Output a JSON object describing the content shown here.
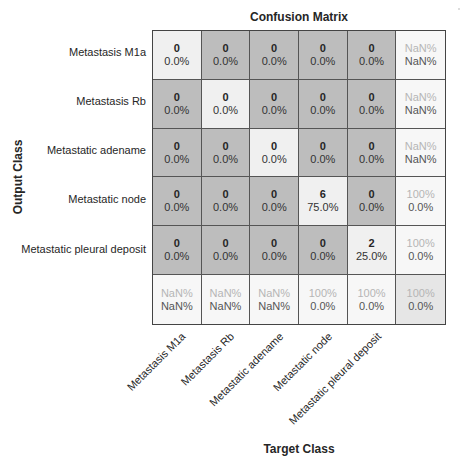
{
  "chart_data": {
    "type": "heatmap",
    "title": "Confusion Matrix",
    "xlabel": "Target Class",
    "ylabel": "Output Class",
    "classes": [
      "Metastasis M1a",
      "Metastasis Rb",
      "Metastatic adename",
      "Metastatic node",
      "Metastatic pleural deposit"
    ],
    "counts": [
      [
        0,
        0,
        0,
        0,
        0
      ],
      [
        0,
        0,
        0,
        0,
        0
      ],
      [
        0,
        0,
        0,
        0,
        0
      ],
      [
        0,
        0,
        0,
        6,
        0
      ],
      [
        0,
        0,
        0,
        0,
        2
      ]
    ],
    "percentages": [
      [
        "0.0%",
        "0.0%",
        "0.0%",
        "0.0%",
        "0.0%"
      ],
      [
        "0.0%",
        "0.0%",
        "0.0%",
        "0.0%",
        "0.0%"
      ],
      [
        "0.0%",
        "0.0%",
        "0.0%",
        "0.0%",
        "0.0%"
      ],
      [
        "0.0%",
        "0.0%",
        "0.0%",
        "75.0%",
        "0.0%"
      ],
      [
        "0.0%",
        "0.0%",
        "0.0%",
        "0.0%",
        "25.0%"
      ]
    ],
    "row_summary": [
      [
        "NaN%",
        "NaN%"
      ],
      [
        "NaN%",
        "NaN%"
      ],
      [
        "NaN%",
        "NaN%"
      ],
      [
        "100%",
        "0.0%"
      ],
      [
        "100%",
        "0.0%"
      ]
    ],
    "col_summary": [
      [
        "NaN%",
        "NaN%"
      ],
      [
        "NaN%",
        "NaN%"
      ],
      [
        "NaN%",
        "NaN%"
      ],
      [
        "100%",
        "0.0%"
      ],
      [
        "100%",
        "0.0%"
      ]
    ],
    "overall": [
      "100%",
      "0.0%"
    ],
    "x_tick_labels": [
      "Metastasis M1a",
      "Metastasis Rb",
      "Metastatic adename",
      "Metastatic node",
      "Metastatic pleural deposit"
    ],
    "colors": {
      "diag": "#f2f2f2",
      "offdiag": "#bdbdbd",
      "summary": "#f7f7f7",
      "overall": "#e6e6e6"
    }
  },
  "cells": [
    {
      "c": "0",
      "p": "0.0%",
      "bg": "#f0f0f0"
    },
    {
      "c": "0",
      "p": "0.0%",
      "bg": "#bdbdbd"
    },
    {
      "c": "0",
      "p": "0.0%",
      "bg": "#bdbdbd"
    },
    {
      "c": "0",
      "p": "0.0%",
      "bg": "#bdbdbd"
    },
    {
      "c": "0",
      "p": "0.0%",
      "bg": "#bdbdbd"
    },
    {
      "c": "NaN%",
      "p": "NaN%",
      "bg": "#f7f7f7",
      "s": 1
    },
    {
      "c": "0",
      "p": "0.0%",
      "bg": "#bdbdbd"
    },
    {
      "c": "0",
      "p": "0.0%",
      "bg": "#f0f0f0"
    },
    {
      "c": "0",
      "p": "0.0%",
      "bg": "#bdbdbd"
    },
    {
      "c": "0",
      "p": "0.0%",
      "bg": "#bdbdbd"
    },
    {
      "c": "0",
      "p": "0.0%",
      "bg": "#bdbdbd"
    },
    {
      "c": "NaN%",
      "p": "NaN%",
      "bg": "#f7f7f7",
      "s": 1
    },
    {
      "c": "0",
      "p": "0.0%",
      "bg": "#bdbdbd"
    },
    {
      "c": "0",
      "p": "0.0%",
      "bg": "#bdbdbd"
    },
    {
      "c": "0",
      "p": "0.0%",
      "bg": "#f0f0f0"
    },
    {
      "c": "0",
      "p": "0.0%",
      "bg": "#bdbdbd"
    },
    {
      "c": "0",
      "p": "0.0%",
      "bg": "#bdbdbd"
    },
    {
      "c": "NaN%",
      "p": "NaN%",
      "bg": "#f7f7f7",
      "s": 1
    },
    {
      "c": "0",
      "p": "0.0%",
      "bg": "#bdbdbd"
    },
    {
      "c": "0",
      "p": "0.0%",
      "bg": "#bdbdbd"
    },
    {
      "c": "0",
      "p": "0.0%",
      "bg": "#bdbdbd"
    },
    {
      "c": "6",
      "p": "75.0%",
      "bg": "#f0f0f0"
    },
    {
      "c": "0",
      "p": "0.0%",
      "bg": "#bdbdbd"
    },
    {
      "c": "100%",
      "p": "0.0%",
      "bg": "#f7f7f7",
      "s": 1
    },
    {
      "c": "0",
      "p": "0.0%",
      "bg": "#bdbdbd"
    },
    {
      "c": "0",
      "p": "0.0%",
      "bg": "#bdbdbd"
    },
    {
      "c": "0",
      "p": "0.0%",
      "bg": "#bdbdbd"
    },
    {
      "c": "0",
      "p": "0.0%",
      "bg": "#bdbdbd"
    },
    {
      "c": "2",
      "p": "25.0%",
      "bg": "#f0f0f0"
    },
    {
      "c": "100%",
      "p": "0.0%",
      "bg": "#f7f7f7",
      "s": 1
    },
    {
      "c": "NaN%",
      "p": "NaN%",
      "bg": "#f7f7f7",
      "s": 1
    },
    {
      "c": "NaN%",
      "p": "NaN%",
      "bg": "#f7f7f7",
      "s": 1
    },
    {
      "c": "NaN%",
      "p": "NaN%",
      "bg": "#f7f7f7",
      "s": 1
    },
    {
      "c": "100%",
      "p": "0.0%",
      "bg": "#f7f7f7",
      "s": 1
    },
    {
      "c": "100%",
      "p": "0.0%",
      "bg": "#f7f7f7",
      "s": 1
    },
    {
      "c": "100%",
      "p": "0.0%",
      "bg": "#e6e6e6",
      "s": 1
    }
  ]
}
